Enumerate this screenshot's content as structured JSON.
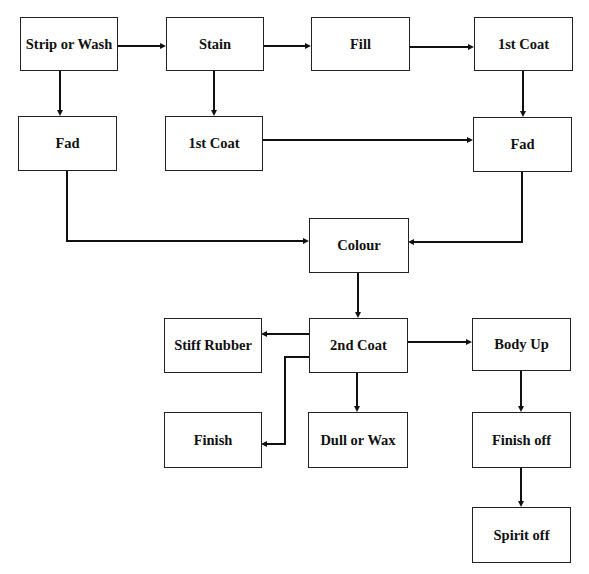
{
  "diagram": {
    "type": "flowchart",
    "nodes": [
      {
        "id": "strip_wash",
        "label": "Strip or Wash"
      },
      {
        "id": "stain",
        "label": "Stain"
      },
      {
        "id": "fill",
        "label": "Fill"
      },
      {
        "id": "first_coat_top",
        "label": "1st Coat"
      },
      {
        "id": "fad_left",
        "label": "Fad"
      },
      {
        "id": "first_coat_mid",
        "label": "1st Coat"
      },
      {
        "id": "fad_right",
        "label": "Fad"
      },
      {
        "id": "colour",
        "label": "Colour"
      },
      {
        "id": "stiff_rubber",
        "label": "Stiff Rubber"
      },
      {
        "id": "second_coat",
        "label": "2nd Coat"
      },
      {
        "id": "body_up",
        "label": "Body Up"
      },
      {
        "id": "finish",
        "label": "Finish"
      },
      {
        "id": "dull_wax",
        "label": "Dull or Wax"
      },
      {
        "id": "finish_off",
        "label": "Finish off"
      },
      {
        "id": "spirit_off",
        "label": "Spirit off"
      }
    ],
    "edges": [
      {
        "from": "strip_wash",
        "to": "stain"
      },
      {
        "from": "stain",
        "to": "fill"
      },
      {
        "from": "fill",
        "to": "first_coat_top"
      },
      {
        "from": "strip_wash",
        "to": "fad_left"
      },
      {
        "from": "stain",
        "to": "first_coat_mid"
      },
      {
        "from": "first_coat_top",
        "to": "fad_right"
      },
      {
        "from": "first_coat_mid",
        "to": "fad_right"
      },
      {
        "from": "fad_left",
        "to": "colour"
      },
      {
        "from": "fad_right",
        "to": "colour"
      },
      {
        "from": "colour",
        "to": "second_coat"
      },
      {
        "from": "second_coat",
        "to": "stiff_rubber"
      },
      {
        "from": "second_coat",
        "to": "finish"
      },
      {
        "from": "second_coat",
        "to": "dull_wax"
      },
      {
        "from": "second_coat",
        "to": "body_up"
      },
      {
        "from": "body_up",
        "to": "finish_off"
      },
      {
        "from": "finish_off",
        "to": "spirit_off"
      }
    ]
  }
}
